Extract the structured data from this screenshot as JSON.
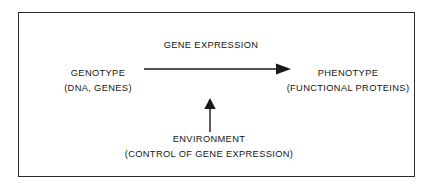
{
  "diagram": {
    "type": "concept-flow",
    "title_text": "GENE EXPRESSION",
    "frame": {
      "border_color": "#2b2b2b",
      "background_color": "#ffffff"
    },
    "nodes": {
      "source": {
        "name": "genotype",
        "line1": "GENOTYPE",
        "line2": "(DNA, GENES)"
      },
      "target": {
        "name": "phenotype",
        "line1": "PHENOTYPE",
        "line2": "(FUNCTIONAL PROTEINS)"
      },
      "modifier": {
        "name": "environment",
        "line1": "ENVIRONMENT",
        "line2": "(CONTROL OF GENE EXPRESSION)"
      }
    },
    "arrows": [
      {
        "name": "gene-expression-arrow",
        "label": "GENE EXPRESSION",
        "direction": "right",
        "from": "genotype",
        "to": "phenotype",
        "color": "#1a1a1a"
      },
      {
        "name": "environment-arrow",
        "label": "",
        "direction": "up",
        "from": "environment",
        "to": "gene-expression-arrow",
        "color": "#1a1a1a"
      }
    ],
    "text_color": "#151515"
  }
}
